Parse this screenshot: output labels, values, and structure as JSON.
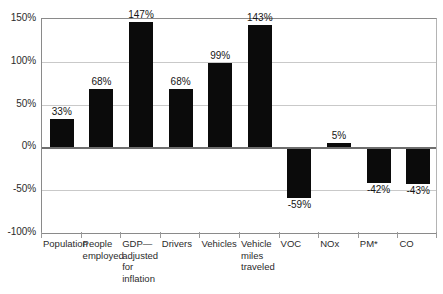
{
  "chart_data": {
    "type": "bar",
    "title": "",
    "subtitle": "",
    "xlabel": "",
    "ylabel": "",
    "ylim": [
      -100,
      150
    ],
    "grid": true,
    "legend": null,
    "y_ticks": [
      "150%",
      "100%",
      "50%",
      "0%",
      "-50%",
      "-100%"
    ],
    "y_tick_values": [
      150,
      100,
      50,
      0,
      -50,
      -100
    ],
    "categories": [
      "Population",
      "People\nemployed",
      "GDP—\nadjusted\nfor\ninflation",
      "Drivers",
      "Vehicles",
      "Vehicle\nmiles\ntraveled",
      "VOC",
      "NOx",
      "PM*",
      "CO"
    ],
    "values": [
      33,
      68,
      147,
      68,
      99,
      143,
      -59,
      5,
      -42,
      -43
    ],
    "data_labels": [
      "33%",
      "68%",
      "147%",
      "68%",
      "99%",
      "143%",
      "-59%",
      "5%",
      "-42%",
      "-43%"
    ],
    "bar_color": "#0b0b0b",
    "axis_color": "#8a8a8a",
    "gridline_color": "#c9c9c9",
    "zero_line_color": "#6e6e6e",
    "background_color": "#ffffff"
  }
}
